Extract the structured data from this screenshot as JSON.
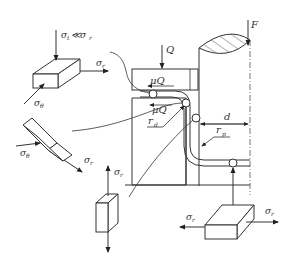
{
  "figure": {
    "type": "deep-drawing stress state diagram",
    "labels": {
      "load_Q": "Q",
      "punch_force": "F",
      "friction_top": "μQ",
      "friction_die": "μQ",
      "die_radius": "r",
      "die_radius_sub": "d",
      "punch_radius": "r",
      "punch_radius_sub": "p",
      "clearance": "d"
    },
    "elements": {
      "flange_element": {
        "condition": "σ",
        "condition_sub": "t",
        "condition_rel": "≪σ",
        "condition_rel_sub": "r",
        "radial": "σ",
        "radial_sub": "r",
        "tangential": "σ",
        "tangential_sub": "θ"
      },
      "die_corner_element": {
        "tangential": "σ",
        "tangential_sub": "θ",
        "radial": "σ",
        "radial_sub": "r"
      },
      "wall_element": {
        "axial": "σ",
        "axial_sub": "r"
      },
      "bottom_element": {
        "left": "σ",
        "left_sub": "r",
        "right": "σ",
        "right_sub": "r"
      }
    },
    "colors": {
      "line": "#333333",
      "background": "#ffffff"
    }
  }
}
